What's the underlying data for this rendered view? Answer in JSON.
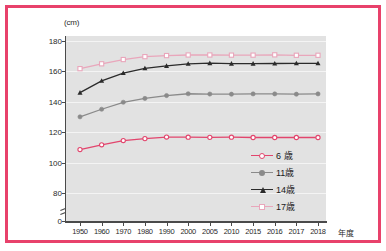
{
  "figure": {
    "border_color": "#e8416b",
    "plot_background": "#e2e2e2",
    "unit_label": "(cm)",
    "xaxis_title": "年度"
  },
  "legend": {
    "position": "right-inside",
    "entries": [
      {
        "label": "6 歳",
        "color": "#e2456d",
        "marker": "circle-open"
      },
      {
        "label": "11歳",
        "color": "#8a8a8a",
        "marker": "circle-fill"
      },
      {
        "label": "14歳",
        "color": "#2b2b2b",
        "marker": "triangle-fill"
      },
      {
        "label": "17歳",
        "color": "#e9a6bb",
        "marker": "square-open"
      }
    ]
  },
  "chart_data": {
    "type": "line",
    "title": "",
    "subtitle": "",
    "xlabel": "年度",
    "ylabel": "(cm)",
    "categories": [
      "1950",
      "1960",
      "1970",
      "1980",
      "1990",
      "2000",
      "2005",
      "2010",
      "2015",
      "2016",
      "2017",
      "2018"
    ],
    "ytick_labels": [
      "180",
      "160",
      "140",
      "120",
      "100",
      "80",
      "0"
    ],
    "ytick_values": [
      180,
      160,
      140,
      120,
      100,
      80,
      0
    ],
    "ylim": [
      78,
      180
    ],
    "y_axis_break": true,
    "y_axis_break_between": [
      0,
      80
    ],
    "grid": true,
    "series": [
      {
        "name": "6 歳",
        "color": "#e2456d",
        "marker": "circle-open",
        "values": [
          108.6,
          111.7,
          114.5,
          115.8,
          116.8,
          116.7,
          116.6,
          116.7,
          116.5,
          116.5,
          116.5,
          116.5
        ]
      },
      {
        "name": "11歳",
        "color": "#8a8a8a",
        "marker": "circle-fill",
        "values": [
          130.1,
          135.1,
          139.7,
          142.2,
          144.1,
          145.3,
          145.1,
          145.0,
          145.2,
          145.2,
          145.0,
          145.2
        ]
      },
      {
        "name": "14歳",
        "color": "#2b2b2b",
        "marker": "triangle-fill",
        "values": [
          146.0,
          153.8,
          158.9,
          162.0,
          163.6,
          165.0,
          165.4,
          165.1,
          165.1,
          165.2,
          165.3,
          165.3
        ]
      },
      {
        "name": "17歳",
        "color": "#e9a6bb",
        "marker": "square-open",
        "values": [
          161.8,
          165.0,
          167.8,
          169.7,
          170.4,
          170.8,
          170.8,
          170.7,
          170.7,
          170.9,
          170.6,
          170.6
        ]
      }
    ]
  }
}
